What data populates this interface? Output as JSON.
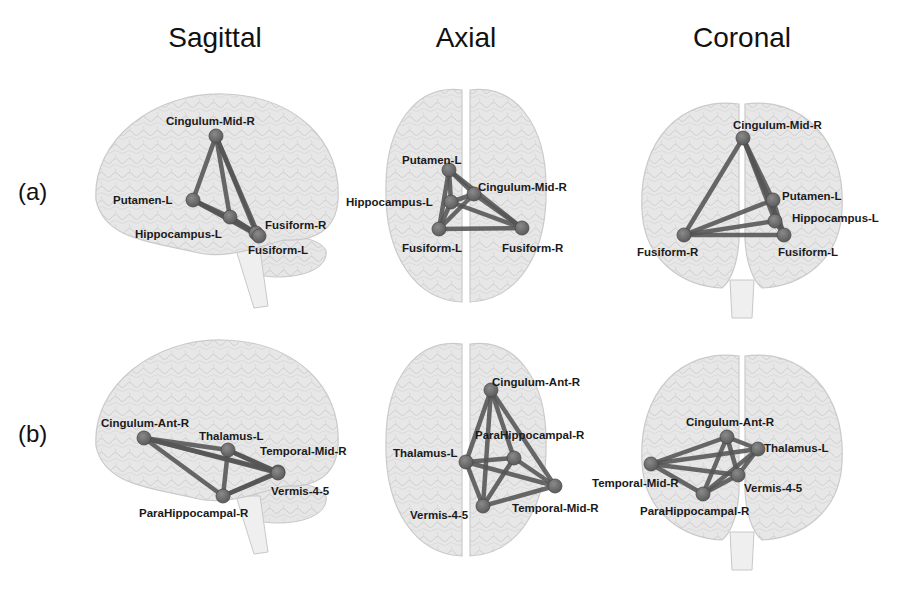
{
  "columns": [
    {
      "title": "Sagittal",
      "x": 215
    },
    {
      "title": "Axial",
      "x": 466
    },
    {
      "title": "Coronal",
      "x": 742
    }
  ],
  "rows": [
    {
      "label": "(a)",
      "y": 178
    },
    {
      "label": "(b)",
      "y": 420
    }
  ],
  "colors": {
    "brain_fill": "#e4e4e4",
    "brain_stroke": "#c8c8c8",
    "brain_texture": "#cfcfcf",
    "edge": "#555555",
    "node": "#6e6e6e",
    "node_stroke": "#4a4a4a",
    "label": "#1a1a1a"
  },
  "panels": [
    {
      "id": "a-sagittal",
      "view": "sagittal",
      "nodes": [
        {
          "name": "Cingulum-Mid-R",
          "x": 216,
          "y": 136,
          "lx": 166,
          "ly": 125
        },
        {
          "name": "Putamen-L",
          "x": 193,
          "y": 200,
          "lx": 113,
          "ly": 204
        },
        {
          "name": "Hippocampus-L",
          "x": 230,
          "y": 217,
          "lx": 135,
          "ly": 238
        },
        {
          "name": "Fusiform-R",
          "x": 256,
          "y": 233,
          "lx": 265,
          "ly": 229
        },
        {
          "name": "Fusiform-L",
          "x": 259,
          "y": 236,
          "lx": 248,
          "ly": 254
        }
      ],
      "edges": [
        [
          0,
          1
        ],
        [
          0,
          2
        ],
        [
          0,
          3
        ],
        [
          0,
          4
        ],
        [
          1,
          2
        ],
        [
          1,
          3
        ],
        [
          1,
          4
        ],
        [
          2,
          3
        ],
        [
          2,
          4
        ],
        [
          3,
          4
        ]
      ]
    },
    {
      "id": "a-axial",
      "view": "axial",
      "nodes": [
        {
          "name": "Putamen-L",
          "x": 449,
          "y": 170,
          "lx": 402,
          "ly": 164
        },
        {
          "name": "Cingulum-Mid-R",
          "x": 474,
          "y": 194,
          "lx": 478,
          "ly": 191
        },
        {
          "name": "Hippocampus-L",
          "x": 451,
          "y": 202,
          "lx": 346,
          "ly": 206
        },
        {
          "name": "Fusiform-L",
          "x": 439,
          "y": 229,
          "lx": 402,
          "ly": 252
        },
        {
          "name": "Fusiform-R",
          "x": 522,
          "y": 228,
          "lx": 502,
          "ly": 252
        }
      ],
      "edges": [
        [
          0,
          1
        ],
        [
          0,
          2
        ],
        [
          0,
          3
        ],
        [
          0,
          4
        ],
        [
          1,
          2
        ],
        [
          1,
          3
        ],
        [
          1,
          4
        ],
        [
          2,
          3
        ],
        [
          2,
          4
        ],
        [
          3,
          4
        ]
      ]
    },
    {
      "id": "a-coronal",
      "view": "coronal",
      "nodes": [
        {
          "name": "Cingulum-Mid-R",
          "x": 743,
          "y": 138,
          "lx": 733,
          "ly": 129
        },
        {
          "name": "Putamen-L",
          "x": 773,
          "y": 200,
          "lx": 782,
          "ly": 200
        },
        {
          "name": "Hippocampus-L",
          "x": 775,
          "y": 221,
          "lx": 792,
          "ly": 222
        },
        {
          "name": "Fusiform-R",
          "x": 684,
          "y": 235,
          "lx": 637,
          "ly": 256
        },
        {
          "name": "Fusiform-L",
          "x": 784,
          "y": 235,
          "lx": 778,
          "ly": 256
        }
      ],
      "edges": [
        [
          0,
          1
        ],
        [
          0,
          2
        ],
        [
          0,
          3
        ],
        [
          0,
          4
        ],
        [
          1,
          2
        ],
        [
          1,
          3
        ],
        [
          1,
          4
        ],
        [
          2,
          3
        ],
        [
          2,
          4
        ],
        [
          3,
          4
        ]
      ]
    },
    {
      "id": "b-sagittal",
      "view": "sagittal",
      "nodes": [
        {
          "name": "Cingulum-Ant-R",
          "x": 144,
          "y": 438,
          "lx": 101,
          "ly": 427
        },
        {
          "name": "Thalamus-L",
          "x": 228,
          "y": 450,
          "lx": 199,
          "ly": 440
        },
        {
          "name": "Temporal-Mid-R",
          "x": 278,
          "y": 472,
          "lx": 260,
          "ly": 455
        },
        {
          "name": "Vermis-4-5",
          "x": 278,
          "y": 473,
          "lx": 271,
          "ly": 495
        },
        {
          "name": "ParaHippocampal-R",
          "x": 223,
          "y": 496,
          "lx": 139,
          "ly": 517
        }
      ],
      "edges": [
        [
          0,
          1
        ],
        [
          0,
          2
        ],
        [
          0,
          3
        ],
        [
          0,
          4
        ],
        [
          1,
          2
        ],
        [
          1,
          3
        ],
        [
          1,
          4
        ],
        [
          2,
          3
        ],
        [
          2,
          4
        ],
        [
          3,
          4
        ]
      ]
    },
    {
      "id": "b-axial",
      "view": "axial",
      "nodes": [
        {
          "name": "Cingulum-Ant-R",
          "x": 491,
          "y": 390,
          "lx": 492,
          "ly": 386
        },
        {
          "name": "ParaHippocampal-R",
          "x": 514,
          "y": 458,
          "lx": 475,
          "ly": 439
        },
        {
          "name": "Thalamus-L",
          "x": 466,
          "y": 462,
          "lx": 393,
          "ly": 457
        },
        {
          "name": "Temporal-Mid-R",
          "x": 555,
          "y": 486,
          "lx": 512,
          "ly": 512
        },
        {
          "name": "Vermis-4-5",
          "x": 483,
          "y": 506,
          "lx": 410,
          "ly": 519
        }
      ],
      "edges": [
        [
          0,
          1
        ],
        [
          0,
          2
        ],
        [
          0,
          3
        ],
        [
          0,
          4
        ],
        [
          1,
          2
        ],
        [
          1,
          3
        ],
        [
          1,
          4
        ],
        [
          2,
          3
        ],
        [
          2,
          4
        ],
        [
          3,
          4
        ]
      ]
    },
    {
      "id": "b-coronal",
      "view": "coronal",
      "nodes": [
        {
          "name": "Cingulum-Ant-R",
          "x": 727,
          "y": 437,
          "lx": 686,
          "ly": 426
        },
        {
          "name": "Thalamus-L",
          "x": 758,
          "y": 449,
          "lx": 764,
          "ly": 452
        },
        {
          "name": "Temporal-Mid-R",
          "x": 651,
          "y": 464,
          "lx": 592,
          "ly": 487
        },
        {
          "name": "Vermis-4-5",
          "x": 738,
          "y": 475,
          "lx": 744,
          "ly": 492
        },
        {
          "name": "ParaHippocampal-R",
          "x": 703,
          "y": 494,
          "lx": 640,
          "ly": 515
        }
      ],
      "edges": [
        [
          0,
          1
        ],
        [
          0,
          2
        ],
        [
          0,
          3
        ],
        [
          0,
          4
        ],
        [
          1,
          2
        ],
        [
          1,
          3
        ],
        [
          1,
          4
        ],
        [
          2,
          3
        ],
        [
          2,
          4
        ],
        [
          3,
          4
        ]
      ]
    }
  ],
  "brains": [
    {
      "view": "sagittal",
      "cx": 214,
      "cy": 190,
      "row": "a"
    },
    {
      "view": "axial",
      "cx": 466,
      "cy": 196,
      "row": "a"
    },
    {
      "view": "coronal",
      "cx": 742,
      "cy": 200,
      "row": "a"
    },
    {
      "view": "sagittal",
      "cx": 214,
      "cy": 436,
      "row": "b"
    },
    {
      "view": "axial",
      "cx": 466,
      "cy": 450,
      "row": "b"
    },
    {
      "view": "coronal",
      "cx": 742,
      "cy": 452,
      "row": "b"
    }
  ]
}
